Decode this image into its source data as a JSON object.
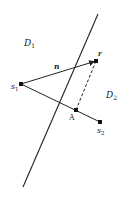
{
  "diagram": {
    "regions": [
      {
        "id": "D1",
        "label": "D",
        "sub": "1",
        "x": 24,
        "y": 46
      },
      {
        "id": "D2",
        "label": "D",
        "sub": "2",
        "x": 106,
        "y": 98
      }
    ],
    "points": {
      "s1": {
        "label": "s",
        "sub": "1",
        "x": 21,
        "y": 84
      },
      "r": {
        "label": "r",
        "x": 96,
        "y": 61
      },
      "A": {
        "label": "A",
        "x": 76,
        "y": 110
      },
      "s2": {
        "label": "s",
        "sub": "2",
        "x": 100,
        "y": 122
      }
    },
    "vector_label": "n",
    "boundary": {
      "x1": 98,
      "y1": 14,
      "x2": 23,
      "y2": 187
    },
    "colors": {
      "ink": "#222222",
      "background": "#ffffff"
    }
  }
}
